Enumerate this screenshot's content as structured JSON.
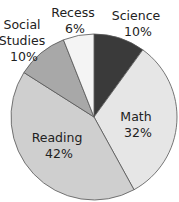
{
  "chart_data": {
    "type": "pie",
    "title": "",
    "categories": [
      "Science",
      "Math",
      "Reading",
      "Social Studies",
      "Recess"
    ],
    "values": [
      10,
      32,
      42,
      10,
      6
    ],
    "unit": "%",
    "labels": [
      {
        "name": "Science",
        "lines": [
          "Science",
          "10%"
        ]
      },
      {
        "name": "Math",
        "lines": [
          "Math",
          "32%"
        ]
      },
      {
        "name": "Reading",
        "lines": [
          "Reading",
          "42%"
        ]
      },
      {
        "name": "Social Studies",
        "lines": [
          "Social",
          "Studies",
          "10%"
        ]
      },
      {
        "name": "Recess",
        "lines": [
          "Recess",
          "6%"
        ]
      }
    ],
    "colors": [
      "#3a3a3a",
      "#e6e6e6",
      "#cfcfcf",
      "#a8a8a8",
      "#f4f4f4"
    ],
    "start_angle_deg": 0,
    "direction": "clockwise",
    "legend": "none"
  }
}
